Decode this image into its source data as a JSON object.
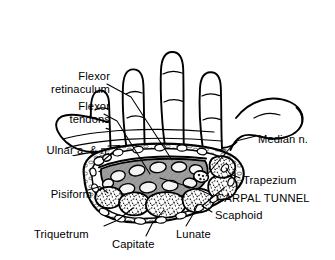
{
  "figure": {
    "type": "anatomical-illustration",
    "background_color": "#ffffff",
    "ink_color": "#000000",
    "tunnel_fill_color": "#9a9a9a",
    "bone_fill_color": "#ffffff"
  },
  "labels": [
    {
      "id": "flexor-retinaculum",
      "text": "Flexor\nretinaculum",
      "align": "right",
      "x": 26,
      "y": 70,
      "width": 84
    },
    {
      "id": "flexor-tendons",
      "text": "Flexor\ntendons",
      "align": "right",
      "x": 36,
      "y": 100,
      "width": 74
    },
    {
      "id": "ulnar-a-n",
      "text": "Ulnar a. & n.",
      "align": "right",
      "x": 6,
      "y": 144,
      "width": 104
    },
    {
      "id": "pisiform",
      "text": "Pisiform",
      "align": "right",
      "x": 18,
      "y": 188,
      "width": 74
    },
    {
      "id": "triquetrum",
      "text": "Triquetrum",
      "align": "left",
      "x": 34,
      "y": 228,
      "width": 74
    },
    {
      "id": "capitate",
      "text": "Capitate",
      "align": "left",
      "x": 112,
      "y": 238,
      "width": 62
    },
    {
      "id": "lunate",
      "text": "Lunate",
      "align": "left",
      "x": 176,
      "y": 228,
      "width": 52
    },
    {
      "id": "scaphoid",
      "text": "Scaphoid",
      "align": "left",
      "x": 215,
      "y": 209,
      "width": 64
    },
    {
      "id": "carpal-tunnel",
      "text": "CARPAL TUNNEL",
      "align": "left",
      "x": 216,
      "y": 192,
      "width": 108
    },
    {
      "id": "trapezium",
      "text": "Trapezium",
      "align": "left",
      "x": 243,
      "y": 174,
      "width": 70
    },
    {
      "id": "median-n",
      "text": "Median n.",
      "align": "left",
      "x": 258,
      "y": 133,
      "width": 66
    }
  ],
  "structures": {
    "carpal_bones": [
      "Pisiform",
      "Triquetrum",
      "Capitate",
      "Lunate",
      "Scaphoid",
      "Trapezium"
    ],
    "soft_tissue": [
      "Flexor retinaculum",
      "Flexor tendons",
      "Median n.",
      "Ulnar a. & n."
    ],
    "digits": [
      "index",
      "middle",
      "ring",
      "little",
      "thumb"
    ]
  }
}
